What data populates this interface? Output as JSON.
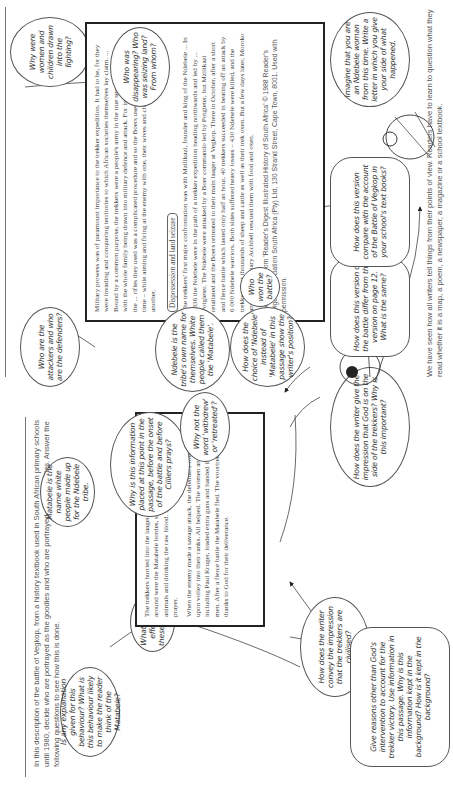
{
  "left_page": {
    "intro": "In this description of the battle of Vegkop, from a history textbook used in South African primary schools until 1980, decide who are portrayed as the goodies and who are portrayed as the baddies. Answer the following questions to see how this is done.",
    "passage": {
      "p1": "The trekkers hurried into the laager and closed the entrance. All around were the Matabele hordes, sharpening their assegais, killing animals and drinking the raw blood. Sarel Cilliers offered up a prayer.",
      "p2": "When the enemy made a savage attack, the defenders fired volley upon volley into their ranks. All helped. The women and children, including Paul Kruger, loaded extra guns and handed them to the men. After a fierce battle the Matabele fled. The voortrekkers gave thanks to God for their deliverance."
    },
    "bubbles": {
      "matabele_name": "Matabele is the name white people made up for the Ndebele tribe.",
      "why_placed": "Why is this information placed at this point in the passage, before the onset of the battle and before Cilliers prays?",
      "why_not_withdrew": "Why not the word 'withdrew' or 'retreated'?",
      "explanation": "Is any explanation given for this behaviour? What is this behaviour likely to make the reader think of the Matabele?",
      "effects": "What are the effects of these words?",
      "civilised": "How does the writer convey the impression that the trekkers are civilised?",
      "god_on_side": "How does the writer give the impression that God is on the side of the trekkers? Why is this important?",
      "reasons": "Give reasons other than God's intervention to account for the trekker victory. Use information in this passage. Why is this information kept in the background? How is it kept in the background?"
    }
  },
  "right_page": {
    "passage": {
      "p1": "Military prowess was of paramount importance to the trekker expedition. It had to be, for they were invading and conquering territories to which African societies themselves lay claim. ... Bound by a common purpose, the trekkers were a people's army in the true sense of the word, with the whole family being drawn into military defence and attack. For instance, the loading of the ... rifles they used was a complicated procedure and so the Boers used more than one gun at a time – while aiming and firing at the enemy with one, their wives and children would be loading another.",
      "section_heading": "Dispossession and land seizure",
      "p2": "The trekkers' first major confrontation was with Mzilikazi, founder and king of the Ndebele ... In 1836 the Ndebele were in the path of a trekker expedition heading northwards and led by ... Potgieter. The Ndebele were attacked by a Boer commando led by Potgieter, but Mzilikazi retaliated and the Boers retreated to their main laager at Vegkop. There in October, after a short and fierce battle which lasted only half an hour, 40 trekkers succeeded in beating off an attack by 6 000 Ndebele warriors. Both sides suffered heavy losses – 430 Ndebele were killed, and the trekkers lost thousands of sheep and cattle as well as their trek oxen. But a few days later, Moroko and the missionary Archbell rescued them with food and oxen.",
      "credit": "Reproduced from 'Reader's Digest Illustrated History of South Africa' © 1988 Reader's Digest Association South Africa (Pty) Ltd, 130 Strand Street, Cape Town, 8001. Used with permission."
    },
    "bubbles": {
      "attackers": "Who are the attackers and who are the defenders?",
      "women_children": "Why were women and children drawn into the fighting?",
      "disappearing": "Who was disappearing? Who was seizing land? From whom?",
      "ndebele_name": "Ndebele is the tribe's own name for themselves. White people called them the 'Matabele'.",
      "choice_of_name": "How does the choice of 'Ndebele' instead of 'Matabele' in this passage show the writer's position?",
      "who_won": "Who won the battle?",
      "how_differ": "How does this version of the battle differ from the version on page 12. What is the same?",
      "how_compare": "How does this version compare with the account of the Battle of Vegkop in your school's text books?",
      "imagine": "Imagine that you are an Ndebele woman from this time. Write a letter in which you give your side of what happened."
    },
    "conclusion": "We have seen how all writers tell things from their points of view. Readers have to learn to question what they read whether it is a map, a poem, a newspaper, a magazine or a school textbook."
  }
}
